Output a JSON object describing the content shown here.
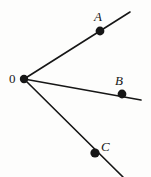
{
  "figure": {
    "type": "geometry-diagram",
    "background_color": "#fdfdfc",
    "ink_color": "#161616",
    "canvas": {
      "width": 151,
      "height": 177
    },
    "vertex": {
      "label": "0",
      "name": "origin-vertex",
      "x": 24,
      "y": 79,
      "dot_radius": 4.2
    },
    "rays": [
      {
        "id": "ray-A",
        "label": "A",
        "from": {
          "x": 24,
          "y": 79
        },
        "through": {
          "x": 100,
          "y": 31
        },
        "to": {
          "x": 130,
          "y": 12
        },
        "point_dot_radius": 4.4,
        "label_position": {
          "x": 94,
          "y": 10
        }
      },
      {
        "id": "ray-B",
        "label": "B",
        "from": {
          "x": 24,
          "y": 79
        },
        "through": {
          "x": 122,
          "y": 94
        },
        "to": {
          "x": 141,
          "y": 100
        },
        "point_dot_radius": 4.4,
        "label_position": {
          "x": 115,
          "y": 74
        }
      },
      {
        "id": "ray-C",
        "label": "C",
        "from": {
          "x": 24,
          "y": 79
        },
        "through": {
          "x": 95,
          "y": 153
        },
        "to": {
          "x": 123,
          "y": 177
        },
        "point_dot_radius": 4.6,
        "label_position": {
          "x": 101,
          "y": 140
        }
      }
    ],
    "labels": {
      "origin": "0",
      "point_a": "A",
      "point_b": "B",
      "point_c": "C"
    },
    "stroke_width": 1.6
  }
}
